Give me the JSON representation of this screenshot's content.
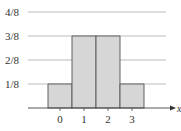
{
  "chart_data": {
    "type": "bar",
    "title": "",
    "xlabel": "x",
    "ylabel": "",
    "categories": [
      "0",
      "1",
      "2",
      "3"
    ],
    "values": [
      0.125,
      0.375,
      0.375,
      0.125
    ],
    "value_labels": [
      "1/8",
      "3/8",
      "3/8",
      "1/8"
    ],
    "yticks": [
      "1/8",
      "2/8",
      "3/8",
      "4/8"
    ],
    "ylim": [
      0,
      0.5
    ],
    "grid": true,
    "legend": null,
    "bar_color": "#d6d6d6",
    "bar_edge_color": "#555555",
    "grid_color": "#aaaaaa"
  }
}
